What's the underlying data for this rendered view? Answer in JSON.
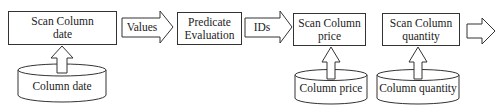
{
  "diagram": {
    "nodes": [
      {
        "id": "scan_date",
        "line1": "Scan Column",
        "line2": "date"
      },
      {
        "id": "predicate",
        "line1": "Predicate",
        "line2": "Evaluation"
      },
      {
        "id": "scan_price",
        "line1": "Scan Column",
        "line2": "price"
      },
      {
        "id": "scan_quantity",
        "line1": "Scan Column",
        "line2": "quantity"
      }
    ],
    "flow_arrows": [
      {
        "from": "scan_date",
        "to": "predicate",
        "label": "Values"
      },
      {
        "from": "predicate",
        "to": "scan_price",
        "label": "IDs"
      },
      {
        "from": "scan_quantity",
        "to": "output",
        "label": ""
      }
    ],
    "storage": [
      {
        "id": "col_date",
        "label": "Column date",
        "feeds": "scan_date"
      },
      {
        "id": "col_price",
        "label": "Column price",
        "feeds": "scan_price"
      },
      {
        "id": "col_quantity",
        "label": "Column quantity",
        "feeds": "scan_quantity"
      }
    ],
    "colors": {
      "stroke": "#333333",
      "fill": "#ffffff",
      "text": "#222222"
    }
  }
}
